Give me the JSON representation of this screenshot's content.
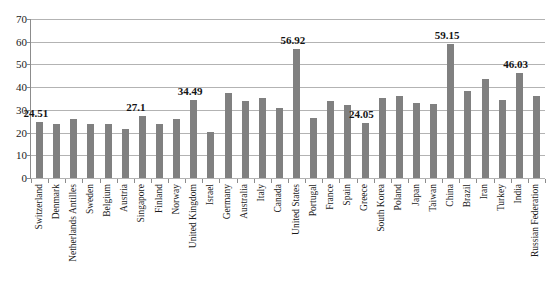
{
  "chart_data": {
    "type": "bar",
    "title": "",
    "xlabel": "",
    "ylabel": "",
    "ylim": [
      0,
      70
    ],
    "y_ticks": [
      0,
      10,
      20,
      30,
      40,
      50,
      60,
      70
    ],
    "grid": true,
    "legend": "none",
    "series_color": "#808080",
    "categories": [
      "Switzerland",
      "Denmark",
      "Netherlands Antilles",
      "Sweden",
      "Belgium",
      "Austria",
      "Singapore",
      "Finland",
      "Norway",
      "United Kingdom",
      "Israel",
      "Germany",
      "Australia",
      "Italy",
      "Canada",
      "United States",
      "Portugal",
      "France",
      "Spain",
      "Greece",
      "South Korea",
      "Poland",
      "Japan",
      "Taiwan",
      "China",
      "Brazil",
      "Iran",
      "Turkey",
      "India",
      "Russian Federation"
    ],
    "values": [
      24.51,
      24.0,
      25.8,
      23.7,
      23.9,
      21.4,
      27.1,
      23.7,
      26.0,
      34.49,
      20.4,
      37.6,
      33.9,
      35.2,
      30.7,
      56.92,
      26.4,
      33.8,
      32.0,
      24.05,
      35.2,
      36.3,
      33.0,
      32.6,
      59.15,
      38.4,
      43.6,
      34.4,
      46.03,
      36.3
    ],
    "labeled_points": [
      {
        "category": "Switzerland",
        "value": 24.51,
        "text": "24.51"
      },
      {
        "category": "Singapore",
        "value": 27.1,
        "text": "27.1"
      },
      {
        "category": "United Kingdom",
        "value": 34.49,
        "text": "34.49"
      },
      {
        "category": "United States",
        "value": 56.92,
        "text": "56.92"
      },
      {
        "category": "Greece",
        "value": 24.05,
        "text": "24.05"
      },
      {
        "category": "China",
        "value": 59.15,
        "text": "59.15"
      },
      {
        "category": "India",
        "value": 46.03,
        "text": "46.03"
      }
    ]
  }
}
